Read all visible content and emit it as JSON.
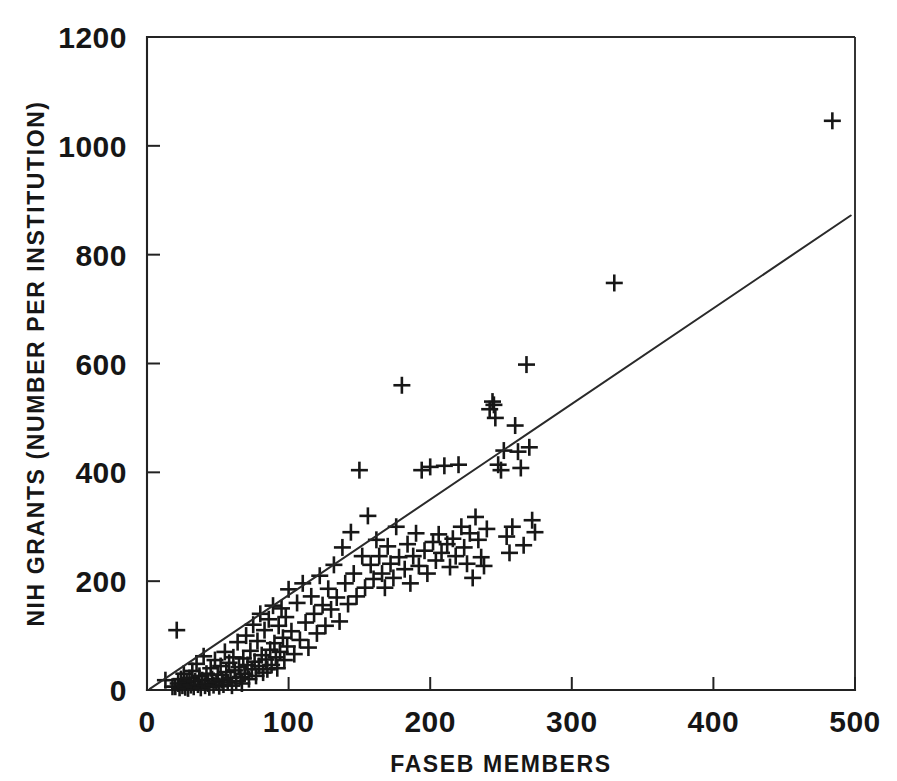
{
  "chart_data": {
    "type": "scatter",
    "title": "",
    "xlabel": "FASEB MEMBERS",
    "ylabel": "NIH GRANTS (NUMBER PER INSTITUTION)",
    "xlim": [
      0,
      500
    ],
    "ylim": [
      0,
      1200
    ],
    "xticks": [
      0,
      100,
      200,
      300,
      400,
      500
    ],
    "yticks": [
      0,
      200,
      400,
      600,
      800,
      1000,
      1200
    ],
    "xtick_labels": [
      "0",
      "100",
      "200",
      "300",
      "400",
      "500"
    ],
    "ytick_labels": [
      "0",
      "200",
      "400",
      "600",
      "800",
      "1000",
      "1200"
    ],
    "grid": false,
    "legend": false,
    "marker": "plus",
    "marker_color": "#171717",
    "line_color": "#2a2a2a",
    "frame_color": "#2b2b2b",
    "background": "#ffffff",
    "series": [
      {
        "name": "Institutions",
        "marker": "plus",
        "points": [
          [
            13,
            18
          ],
          [
            18,
            6
          ],
          [
            20,
            6
          ],
          [
            21,
            110
          ],
          [
            22,
            12
          ],
          [
            23,
            4
          ],
          [
            24,
            20
          ],
          [
            25,
            8
          ],
          [
            26,
            30
          ],
          [
            27,
            5
          ],
          [
            28,
            14
          ],
          [
            29,
            3
          ],
          [
            30,
            22
          ],
          [
            31,
            9
          ],
          [
            32,
            35
          ],
          [
            33,
            6
          ],
          [
            34,
            16
          ],
          [
            35,
            48
          ],
          [
            36,
            10
          ],
          [
            37,
            26
          ],
          [
            38,
            4
          ],
          [
            39,
            18
          ],
          [
            40,
            62
          ],
          [
            41,
            8
          ],
          [
            42,
            30
          ],
          [
            43,
            12
          ],
          [
            44,
            5
          ],
          [
            45,
            40
          ],
          [
            46,
            20
          ],
          [
            47,
            9
          ],
          [
            48,
            55
          ],
          [
            49,
            15
          ],
          [
            50,
            28
          ],
          [
            51,
            7
          ],
          [
            52,
            44
          ],
          [
            53,
            18
          ],
          [
            54,
            10
          ],
          [
            55,
            70
          ],
          [
            56,
            33
          ],
          [
            57,
            14
          ],
          [
            58,
            50
          ],
          [
            59,
            22
          ],
          [
            60,
            8
          ],
          [
            61,
            60
          ],
          [
            62,
            36
          ],
          [
            63,
            16
          ],
          [
            64,
            88
          ],
          [
            65,
            42
          ],
          [
            66,
            24
          ],
          [
            67,
            12
          ],
          [
            68,
            58
          ],
          [
            69,
            30
          ],
          [
            70,
            100
          ],
          [
            71,
            46
          ],
          [
            72,
            20
          ],
          [
            73,
            72
          ],
          [
            74,
            38
          ],
          [
            75,
            120
          ],
          [
            76,
            52
          ],
          [
            77,
            26
          ],
          [
            78,
            90
          ],
          [
            79,
            44
          ],
          [
            80,
            140
          ],
          [
            81,
            64
          ],
          [
            82,
            32
          ],
          [
            83,
            110
          ],
          [
            84,
            56
          ],
          [
            85,
            38
          ],
          [
            86,
            130
          ],
          [
            87,
            74
          ],
          [
            88,
            46
          ],
          [
            89,
            155
          ],
          [
            90,
            86
          ],
          [
            91,
            60
          ],
          [
            92,
            40
          ],
          [
            93,
            118
          ],
          [
            94,
            70
          ],
          [
            95,
            150
          ],
          [
            96,
            96
          ],
          [
            97,
            55
          ],
          [
            98,
            134
          ],
          [
            99,
            80
          ],
          [
            100,
            185
          ],
          [
            102,
            108
          ],
          [
            104,
            66
          ],
          [
            106,
            160
          ],
          [
            108,
            92
          ],
          [
            110,
            196
          ],
          [
            112,
            124
          ],
          [
            114,
            78
          ],
          [
            116,
            172
          ],
          [
            118,
            140
          ],
          [
            120,
            104
          ],
          [
            122,
            210
          ],
          [
            124,
            156
          ],
          [
            126,
            118
          ],
          [
            128,
            186
          ],
          [
            130,
            148
          ],
          [
            132,
            230
          ],
          [
            134,
            170
          ],
          [
            136,
            126
          ],
          [
            138,
            262
          ],
          [
            140,
            196
          ],
          [
            142,
            158
          ],
          [
            144,
            290
          ],
          [
            146,
            214
          ],
          [
            148,
            172
          ],
          [
            150,
            404
          ],
          [
            152,
            246
          ],
          [
            154,
            188
          ],
          [
            156,
            320
          ],
          [
            158,
            230
          ],
          [
            160,
            204
          ],
          [
            162,
            276
          ],
          [
            164,
            246
          ],
          [
            166,
            214
          ],
          [
            168,
            188
          ],
          [
            170,
            264
          ],
          [
            172,
            232
          ],
          [
            174,
            206
          ],
          [
            176,
            300
          ],
          [
            178,
            244
          ],
          [
            180,
            560
          ],
          [
            182,
            222
          ],
          [
            184,
            268
          ],
          [
            186,
            196
          ],
          [
            188,
            246
          ],
          [
            190,
            288
          ],
          [
            192,
            228
          ],
          [
            194,
            404
          ],
          [
            196,
            256
          ],
          [
            198,
            214
          ],
          [
            200,
            410
          ],
          [
            202,
            272
          ],
          [
            204,
            238
          ],
          [
            206,
            286
          ],
          [
            208,
            252
          ],
          [
            210,
            412
          ],
          [
            212,
            268
          ],
          [
            214,
            226
          ],
          [
            216,
            278
          ],
          [
            218,
            246
          ],
          [
            220,
            414
          ],
          [
            222,
            300
          ],
          [
            224,
            262
          ],
          [
            226,
            232
          ],
          [
            228,
            288
          ],
          [
            230,
            206
          ],
          [
            232,
            318
          ],
          [
            234,
            276
          ],
          [
            236,
            244
          ],
          [
            238,
            228
          ],
          [
            240,
            296
          ],
          [
            242,
            516
          ],
          [
            244,
            530
          ],
          [
            245,
            524
          ],
          [
            246,
            500
          ],
          [
            248,
            414
          ],
          [
            250,
            404
          ],
          [
            252,
            440
          ],
          [
            254,
            282
          ],
          [
            256,
            252
          ],
          [
            258,
            300
          ],
          [
            260,
            486
          ],
          [
            262,
            438
          ],
          [
            264,
            408
          ],
          [
            266,
            266
          ],
          [
            268,
            598
          ],
          [
            270,
            446
          ],
          [
            272,
            312
          ],
          [
            274,
            290
          ],
          [
            330,
            748
          ],
          [
            484,
            1046
          ]
        ]
      }
    ],
    "fit_line": {
      "name": "regression line",
      "x_start": 2,
      "y_start": 2,
      "x_end": 497,
      "y_end": 872
    }
  }
}
